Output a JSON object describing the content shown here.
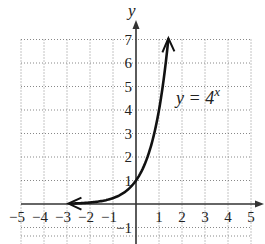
{
  "chart_data": {
    "type": "line",
    "title": "",
    "xlabel": "",
    "ylabel": "y",
    "xlim": [
      -5,
      5
    ],
    "ylim": [
      -1.5,
      7.5
    ],
    "grid": true,
    "grid_style": "dotted",
    "x_ticks": [
      "−5",
      "−4",
      "−3",
      "−2",
      "−1",
      "1",
      "2",
      "3",
      "4",
      "5"
    ],
    "y_ticks": [
      "−1",
      "1",
      "2",
      "3",
      "4",
      "5",
      "6",
      "7"
    ],
    "series": [
      {
        "name": "y = 4^x",
        "function": "4^x",
        "x": [
          -3,
          -2.5,
          -2,
          -1.5,
          -1,
          -0.5,
          0,
          0.5,
          1,
          1.4
        ],
        "y": [
          0.016,
          0.031,
          0.0625,
          0.125,
          0.25,
          0.5,
          1,
          2,
          4,
          7
        ],
        "arrows": "both"
      }
    ],
    "annotations": [
      {
        "text": "y = 4",
        "superscript": "x",
        "x": 1.6,
        "y": 4.5
      }
    ]
  },
  "labels": {
    "y_axis": "y",
    "equation_base": "y = 4",
    "equation_exp": "x"
  },
  "colors": {
    "curve": "#111111",
    "axis": "#333333",
    "grid": "#888888"
  }
}
